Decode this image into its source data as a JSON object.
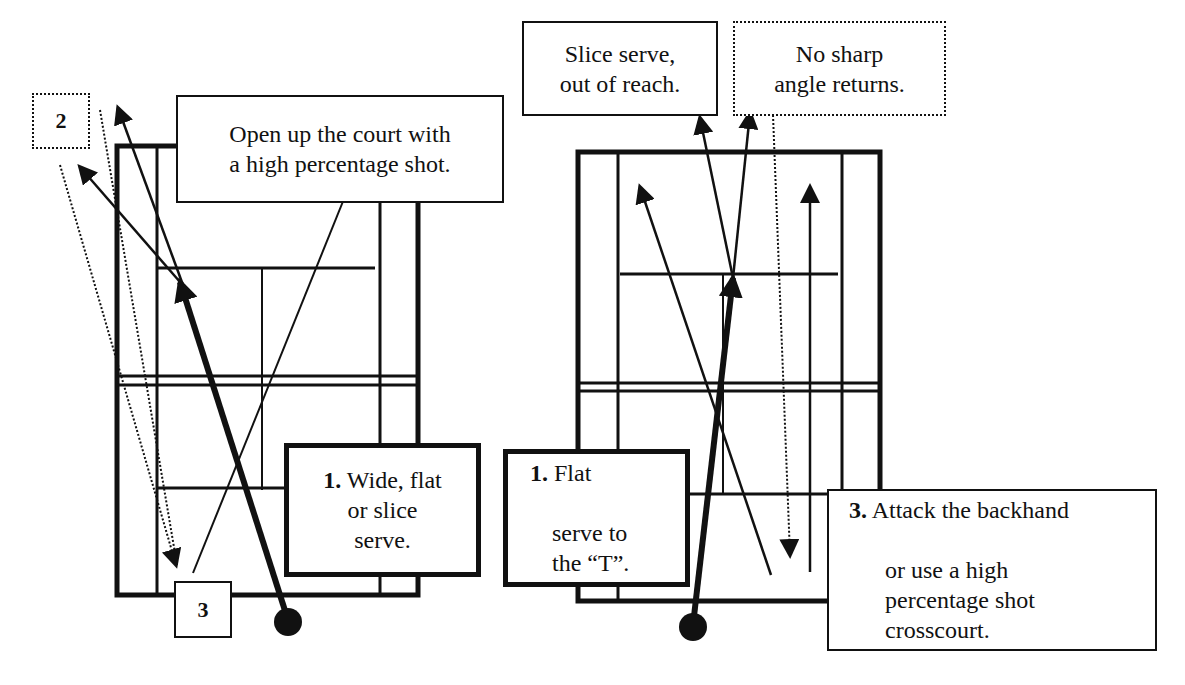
{
  "diagram": {
    "left_court": {
      "callouts": [
        {
          "id": "step-2",
          "label": "2",
          "style": "dotted"
        },
        {
          "id": "open-court",
          "text": "Open up the court with\na high percentage shot.",
          "style": "solid"
        },
        {
          "id": "serve-wide",
          "number": "1.",
          "text": " Wide, flat\nor slice\nserve.",
          "style": "thick"
        },
        {
          "id": "step-3",
          "label": "3",
          "style": "solid"
        }
      ]
    },
    "right_court": {
      "callouts": [
        {
          "id": "slice-serve",
          "text": "Slice serve,\nout of reach.",
          "style": "solid"
        },
        {
          "id": "no-sharp-angle",
          "text": "No sharp\nangle returns.",
          "style": "dotted"
        },
        {
          "id": "serve-t",
          "number": "1.",
          "line1": " Flat",
          "rest": "serve to\nthe “T”.",
          "style": "thick"
        },
        {
          "id": "attack-backhand",
          "number": "3.",
          "line1": " Attack the backhand",
          "rest": "or use a high\npercentage shot\ncrosscourt.",
          "style": "solid"
        }
      ]
    },
    "colors": {
      "line": "#111111",
      "background": "#ffffff"
    }
  }
}
